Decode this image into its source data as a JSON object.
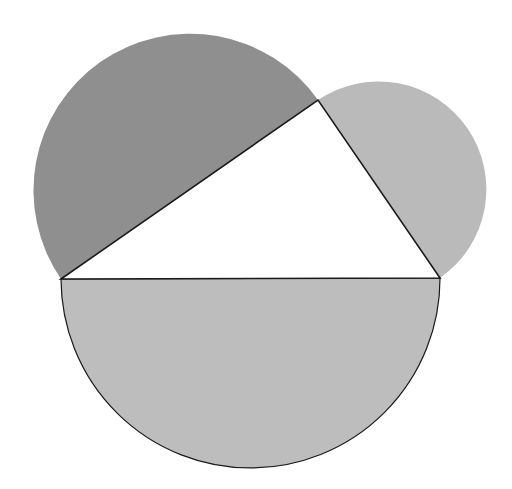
{
  "diagram": {
    "background": "#ffffff",
    "stroke_color": "#1a1a1a",
    "triangle": {
      "vertices": {
        "A": [
          61,
          279
        ],
        "B": [
          440,
          278
        ],
        "C": [
          318,
          100
        ]
      },
      "fill": "#ffffff"
    },
    "semicircles": [
      {
        "side": "AB",
        "label": "bottom-semicircle",
        "fill": "#bdbdbd"
      },
      {
        "side": "AC",
        "label": "left-semicircle",
        "fill": "#8f8f8f"
      },
      {
        "side": "CB",
        "label": "right-semicircle",
        "fill": "#bababa"
      }
    ]
  }
}
